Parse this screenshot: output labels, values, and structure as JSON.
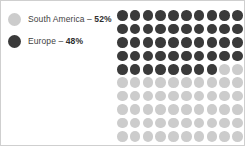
{
  "chart_data": {
    "type": "pie",
    "title": "",
    "subtitle": "",
    "xlabel": "",
    "ylabel": "",
    "categories": [
      "South America",
      "Europe"
    ],
    "values": [
      52,
      48
    ],
    "units": "%",
    "total_units": 100,
    "grid": {
      "rows": 10,
      "columns": 10,
      "total_cells": 100,
      "fill_order": "row-major-top-left",
      "dark_cells": 48,
      "light_cells": 52
    },
    "legend": {
      "position": "left",
      "entries": [
        {
          "label": "South America",
          "separator": "–",
          "value": "52%",
          "color": "#cccccc",
          "marker": "circle"
        },
        {
          "label": "Europe",
          "separator": "–",
          "value": "48%",
          "color": "#3a3a3a",
          "marker": "circle"
        }
      ]
    },
    "colors": {
      "south_america": "#cccccc",
      "europe": "#3a3a3a",
      "background": "#ffffff",
      "border": "#cfcfcf",
      "legend_text": "#3f3f3f"
    },
    "annotations": [],
    "gridlines": false
  }
}
